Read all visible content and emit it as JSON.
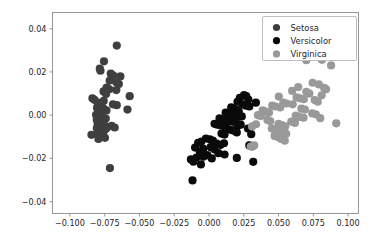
{
  "figure": {
    "background": "#ffffff",
    "width": 383,
    "height": 245
  },
  "chart_data": {
    "type": "scatter",
    "title": "",
    "xlabel": "",
    "ylabel": "",
    "xlim": [
      -0.1125,
      0.1075
    ],
    "ylim": [
      -0.0455,
      0.0475
    ],
    "grid": false,
    "legend_position": "upper right",
    "xticks": [
      -0.1,
      -0.075,
      -0.05,
      -0.025,
      0.0,
      0.025,
      0.05,
      0.075,
      0.1
    ],
    "xticklabels": [
      "−0.100",
      "−0.075",
      "−0.050",
      "−0.025",
      "0.000",
      "0.025",
      "0.050",
      "0.075",
      "0.100"
    ],
    "yticks": [
      0.04,
      0.02,
      0.0,
      -0.02,
      -0.04
    ],
    "yticklabels": [
      "0.04",
      "0.02",
      "0.00",
      "−0.02",
      "−0.04"
    ],
    "marker": "circle",
    "marker_size": 4.1,
    "series": [
      {
        "name": "Setosa",
        "color": "#3f3f3f",
        "points": [
          [
            -0.0663,
            0.0322
          ],
          [
            -0.0755,
            0.0249
          ],
          [
            -0.0785,
            0.0215
          ],
          [
            -0.078,
            0.0206
          ],
          [
            -0.0706,
            0.0192
          ],
          [
            -0.0688,
            0.0183
          ],
          [
            -0.0637,
            0.0179
          ],
          [
            -0.0714,
            0.016
          ],
          [
            -0.0667,
            0.0152
          ],
          [
            -0.0648,
            0.0144
          ],
          [
            -0.0736,
            0.0128
          ],
          [
            -0.0716,
            0.012
          ],
          [
            -0.0666,
            0.0116
          ],
          [
            -0.0758,
            0.011
          ],
          [
            -0.074,
            0.0098
          ],
          [
            -0.057,
            0.0088
          ],
          [
            -0.0838,
            0.0078
          ],
          [
            -0.0824,
            0.0071
          ],
          [
            -0.0757,
            0.0066
          ],
          [
            -0.08,
            0.0058
          ],
          [
            -0.0779,
            0.0053
          ],
          [
            -0.069,
            0.005
          ],
          [
            -0.0663,
            0.0046
          ],
          [
            -0.0792,
            0.0042
          ],
          [
            -0.0775,
            0.0038
          ],
          [
            -0.0805,
            0.0034
          ],
          [
            -0.076,
            0.0031
          ],
          [
            -0.0586,
            0.0026
          ],
          [
            -0.0737,
            0.0022
          ],
          [
            -0.0797,
            0.0016
          ],
          [
            -0.0786,
            0.001
          ],
          [
            -0.0771,
            0.0006
          ],
          [
            -0.0812,
            0.0002
          ],
          [
            -0.0798,
            -0.0003
          ],
          [
            -0.0782,
            -0.0008
          ],
          [
            -0.076,
            -0.0011
          ],
          [
            -0.0742,
            -0.0016
          ],
          [
            -0.0807,
            -0.0021
          ],
          [
            -0.079,
            -0.0026
          ],
          [
            -0.0773,
            -0.003
          ],
          [
            -0.0758,
            -0.0035
          ],
          [
            -0.08,
            -0.004
          ],
          [
            -0.0785,
            -0.0045
          ],
          [
            -0.0768,
            -0.0048
          ],
          [
            -0.0746,
            -0.0052
          ],
          [
            -0.07,
            -0.005
          ],
          [
            -0.0678,
            -0.0057
          ],
          [
            -0.0806,
            -0.006
          ],
          [
            -0.079,
            -0.0064
          ],
          [
            -0.0772,
            -0.0068
          ],
          [
            -0.0755,
            -0.0072
          ],
          [
            -0.0738,
            -0.0062
          ],
          [
            -0.0845,
            -0.0091
          ],
          [
            -0.08,
            -0.0086
          ],
          [
            -0.0782,
            -0.0094
          ],
          [
            -0.0765,
            -0.01
          ],
          [
            -0.0795,
            -0.011
          ],
          [
            -0.0748,
            -0.0105
          ],
          [
            -0.0712,
            -0.0245
          ]
        ]
      },
      {
        "name": "Versicolor",
        "color": "#0a0a0a",
        "points": [
          [
            0.0252,
            0.0093
          ],
          [
            0.0268,
            0.0088
          ],
          [
            0.0222,
            0.008
          ],
          [
            0.0283,
            0.0072
          ],
          [
            0.0205,
            0.0062
          ],
          [
            0.0337,
            0.0058
          ],
          [
            0.024,
            0.005
          ],
          [
            0.0265,
            0.0044
          ],
          [
            0.029,
            0.004
          ],
          [
            0.016,
            0.0036
          ],
          [
            0.0178,
            0.003
          ],
          [
            0.0196,
            0.0024
          ],
          [
            0.0214,
            0.0018
          ],
          [
            0.012,
            0.0012
          ],
          [
            0.0142,
            0.0008
          ],
          [
            0.0168,
            0.0002
          ],
          [
            0.019,
            -0.0002
          ],
          [
            0.0212,
            -0.0006
          ],
          [
            0.0236,
            -0.0006
          ],
          [
            0.0076,
            -0.0015
          ],
          [
            0.0098,
            -0.002
          ],
          [
            0.0122,
            -0.0025
          ],
          [
            0.0145,
            -0.0028
          ],
          [
            0.017,
            -0.003
          ],
          [
            0.0195,
            -0.0034
          ],
          [
            0.004,
            -0.004
          ],
          [
            0.006,
            -0.0044
          ],
          [
            0.0085,
            -0.0048
          ],
          [
            0.0112,
            -0.0052
          ],
          [
            0.0205,
            -0.005
          ],
          [
            0.0228,
            -0.0044
          ],
          [
            0.013,
            -0.0062
          ],
          [
            0.0155,
            -0.0068
          ],
          [
            0.0178,
            -0.0072
          ],
          [
            0.02,
            -0.008
          ],
          [
            0.009,
            -0.0085
          ],
          [
            0.0112,
            -0.009
          ],
          [
            0.0304,
            -0.0088
          ],
          [
            0.028,
            -0.0062
          ],
          [
            -0.0022,
            -0.0108
          ],
          [
            0.0005,
            -0.0112
          ],
          [
            0.0028,
            -0.0118
          ],
          [
            -0.0055,
            -0.0122
          ],
          [
            -0.0078,
            -0.0128
          ],
          [
            0.0056,
            -0.0132
          ],
          [
            0.0082,
            -0.0138
          ],
          [
            0.0108,
            -0.013
          ],
          [
            0.029,
            -0.014
          ],
          [
            0.031,
            -0.0144
          ],
          [
            -0.01,
            -0.015
          ],
          [
            -0.0042,
            -0.0155
          ],
          [
            0.0012,
            -0.0148
          ],
          [
            0.0038,
            -0.0158
          ],
          [
            -0.0065,
            -0.0172
          ],
          [
            0.0068,
            -0.0176
          ],
          [
            0.0112,
            -0.0182
          ],
          [
            -0.0012,
            -0.0185
          ],
          [
            -0.009,
            -0.0196
          ],
          [
            -0.004,
            -0.0192
          ],
          [
            0.002,
            -0.02
          ],
          [
            0.02,
            -0.0198
          ],
          [
            -0.013,
            -0.0205
          ],
          [
            -0.0112,
            -0.0215
          ],
          [
            -0.0058,
            -0.0228
          ],
          [
            0.0318,
            -0.0216
          ],
          [
            -0.0118,
            -0.0302
          ]
        ]
      },
      {
        "name": "Virginica",
        "color": "#999999",
        "points": [
          [
            0.07,
            0.0254
          ],
          [
            0.0812,
            0.0256
          ],
          [
            0.0878,
            0.023
          ],
          [
            0.0745,
            0.015
          ],
          [
            0.079,
            0.0142
          ],
          [
            0.0642,
            0.013
          ],
          [
            0.0828,
            0.0126
          ],
          [
            0.0842,
            0.012
          ],
          [
            0.0598,
            0.0112
          ],
          [
            0.07,
            0.0108
          ],
          [
            0.0722,
            0.01
          ],
          [
            0.081,
            0.0092
          ],
          [
            0.0502,
            0.0086
          ],
          [
            0.063,
            0.0082
          ],
          [
            0.0655,
            0.0078
          ],
          [
            0.0682,
            0.0074
          ],
          [
            0.076,
            0.007
          ],
          [
            0.0782,
            0.0062
          ],
          [
            0.0535,
            0.0058
          ],
          [
            0.0558,
            0.0054
          ],
          [
            0.0602,
            0.005
          ],
          [
            0.0455,
            0.0044
          ],
          [
            0.0478,
            0.004
          ],
          [
            0.0512,
            0.0036
          ],
          [
            0.0665,
            0.003
          ],
          [
            0.069,
            0.0026
          ],
          [
            0.0386,
            0.0022
          ],
          [
            0.0408,
            0.0016
          ],
          [
            0.0432,
            0.0012
          ],
          [
            0.0742,
            0.0008
          ],
          [
            0.0768,
            0.0004
          ],
          [
            0.0352,
            0.0
          ],
          [
            0.0372,
            -0.0004
          ],
          [
            0.0624,
            -0.0002
          ],
          [
            0.065,
            -0.0008
          ],
          [
            0.068,
            -0.0012
          ],
          [
            0.08,
            -0.0014
          ],
          [
            0.042,
            -0.0022
          ],
          [
            0.044,
            -0.0028
          ],
          [
            0.0592,
            -0.003
          ],
          [
            0.0618,
            -0.0036
          ],
          [
            0.0338,
            -0.0042
          ],
          [
            0.05,
            -0.004
          ],
          [
            0.0524,
            -0.0046
          ],
          [
            0.0548,
            -0.0052
          ],
          [
            0.0452,
            -0.0062
          ],
          [
            0.0478,
            -0.0068
          ],
          [
            0.0505,
            -0.0074
          ],
          [
            0.053,
            -0.008
          ],
          [
            0.0555,
            -0.0086
          ],
          [
            0.0472,
            -0.0096
          ],
          [
            0.0498,
            -0.0102
          ],
          [
            0.052,
            -0.011
          ],
          [
            0.0545,
            -0.0118
          ],
          [
            0.031,
            -0.0052
          ],
          [
            0.0325,
            -0.014
          ],
          [
            0.03,
            -0.0145
          ],
          [
            0.0915,
            -0.0038
          ]
        ]
      }
    ]
  },
  "legend": {
    "entries": [
      {
        "label": "Setosa",
        "color": "#3f3f3f"
      },
      {
        "label": "Versicolor",
        "color": "#0a0a0a"
      },
      {
        "label": "Virginica",
        "color": "#999999"
      }
    ]
  }
}
